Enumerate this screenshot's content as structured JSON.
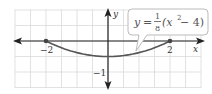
{
  "chart_data": {
    "type": "line",
    "title": "",
    "equation": {
      "lhs": "y",
      "equals": "=",
      "frac_num": "1",
      "frac_den": "8",
      "rest_open": "(x",
      "exponent": "2",
      "rest_close": " − 4)"
    },
    "xlabel": "x",
    "ylabel": "y",
    "x_tick_labels": [
      {
        "value": -2,
        "label": "−2"
      },
      {
        "value": 2,
        "label": "2"
      }
    ],
    "y_tick_labels": [
      {
        "value": -1,
        "label": "−1"
      }
    ],
    "xlim": [
      -3,
      3
    ],
    "ylim": [
      -1.5,
      1
    ],
    "grid": true,
    "grid_step": 0.5,
    "series": [
      {
        "name": "y = 1/8 (x^2 - 4)",
        "x": [
          -2,
          -1.5,
          -1,
          -0.5,
          0,
          0.5,
          1,
          1.5,
          2
        ],
        "y": [
          0,
          -0.21875,
          -0.375,
          -0.46875,
          -0.5,
          -0.46875,
          -0.375,
          -0.21875,
          0
        ]
      }
    ],
    "points": [
      {
        "x": -2,
        "y": 0
      },
      {
        "x": 2,
        "y": 0
      }
    ],
    "colors": {
      "grid": "#d9d9d9",
      "axis": "#222222",
      "curve": "#555555",
      "callout_border": "#bbbbbb"
    }
  }
}
